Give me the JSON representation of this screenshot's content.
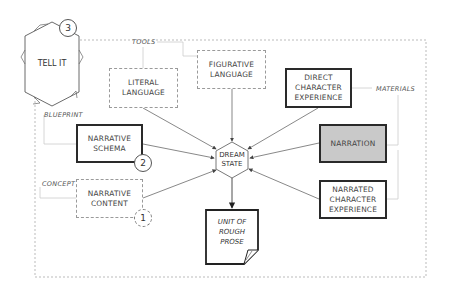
{
  "diagram": {
    "title_node": {
      "label": "TELL IT",
      "badge": "3"
    },
    "hub": {
      "label": "DREAM\nSTATE"
    },
    "output": {
      "label": "UNIT OF\nROUGH\nPROSE"
    },
    "groups": {
      "tools": "TOOLS",
      "materials": "MATERIALS",
      "blueprint": "BLUEPRINT",
      "concept": "CONCEPT"
    },
    "nodes": [
      {
        "id": "literal",
        "label": "LITERAL\nLANGUAGE",
        "style": "dashed"
      },
      {
        "id": "figurative",
        "label": "FIGURATIVE\nLANGUAGE",
        "style": "dashed"
      },
      {
        "id": "direct",
        "label": "DIRECT\nCHARACTER\nEXPERIENCE",
        "style": "solid"
      },
      {
        "id": "narration",
        "label": "NARRATION",
        "style": "solid-shaded"
      },
      {
        "id": "narrated",
        "label": "NARRATED\nCHARACTER\nEXPERIENCE",
        "style": "solid"
      },
      {
        "id": "schema",
        "label": "NARRATIVE\nSCHEMA",
        "style": "solid",
        "badge": "2"
      },
      {
        "id": "content",
        "label": "NARRATIVE\nCONTENT",
        "style": "dashed",
        "badge": "1"
      }
    ],
    "colors": {
      "stroke": "#2a2a2a",
      "dashed": "#9a9a9a",
      "shaded_fill": "#c9c9c9"
    }
  }
}
